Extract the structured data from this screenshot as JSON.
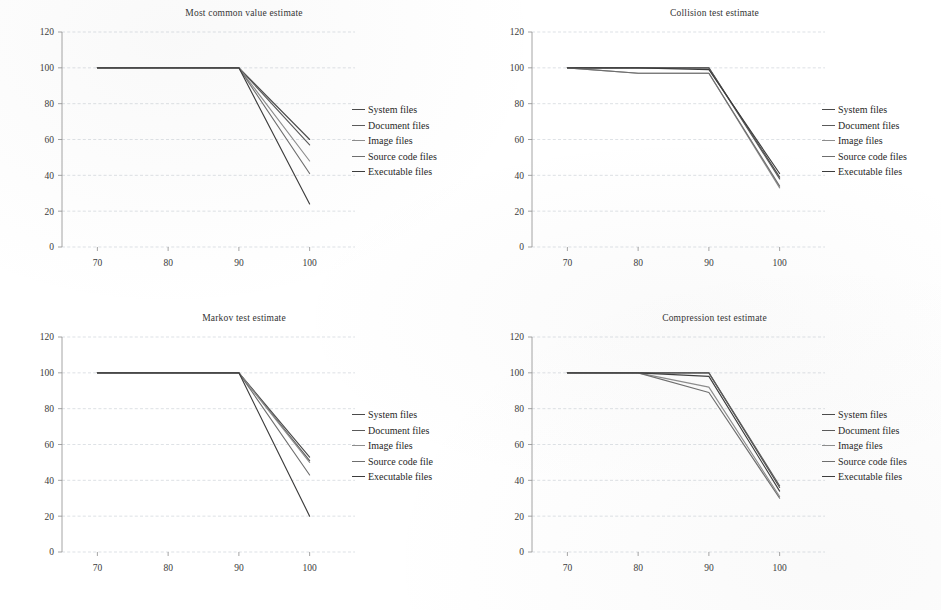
{
  "page": {
    "background": "#ffffff",
    "ink": "#2b2b2b"
  },
  "axes": {
    "y_ticks": [
      "0",
      "20",
      "40",
      "60",
      "80",
      "100",
      "120"
    ],
    "x_ticks": [
      "70",
      "80",
      "90",
      "100"
    ],
    "ylim": [
      0,
      120
    ],
    "xlim": [
      65,
      105
    ],
    "grid": true
  },
  "series_colors": [
    "#4a4a4a",
    "#5a5a5a",
    "#8d8d8d",
    "#6e6e6e",
    "#3c3c3c"
  ],
  "chart_data": [
    {
      "type": "line",
      "title": "Most common value estimate",
      "xlabel": "",
      "ylabel": "",
      "x": [
        70,
        90,
        100
      ],
      "xlim": [
        65,
        105
      ],
      "ylim": [
        0,
        120
      ],
      "grid": true,
      "legend_position": "right",
      "series": [
        {
          "name": "System files",
          "values": [
            100,
            100,
            60
          ]
        },
        {
          "name": "Document files",
          "values": [
            100,
            100,
            57
          ]
        },
        {
          "name": "Image files",
          "values": [
            100,
            100,
            48
          ]
        },
        {
          "name": "Source code files",
          "values": [
            100,
            100,
            41
          ]
        },
        {
          "name": "Executable files",
          "values": [
            100,
            100,
            24
          ]
        }
      ]
    },
    {
      "type": "line",
      "title": "Collision test estimate",
      "xlabel": "",
      "ylabel": "",
      "x": [
        70,
        80,
        90,
        100
      ],
      "xlim": [
        65,
        105
      ],
      "ylim": [
        0,
        120
      ],
      "grid": true,
      "legend_position": "right",
      "series": [
        {
          "name": "System files",
          "values": [
            100,
            100,
            100,
            39
          ]
        },
        {
          "name": "Document files",
          "values": [
            100,
            100,
            100,
            38
          ]
        },
        {
          "name": "Image files",
          "values": [
            100,
            97,
            97,
            33
          ]
        },
        {
          "name": "Source code files",
          "values": [
            100,
            97,
            97,
            34
          ]
        },
        {
          "name": "Executable files",
          "values": [
            100,
            100,
            99,
            41
          ]
        }
      ]
    },
    {
      "type": "line",
      "title": "Markov test estimate",
      "xlabel": "",
      "ylabel": "",
      "x": [
        70,
        90,
        100
      ],
      "xlim": [
        65,
        105
      ],
      "ylim": [
        0,
        120
      ],
      "grid": true,
      "legend_position": "right",
      "series": [
        {
          "name": "System files",
          "values": [
            100,
            100,
            53
          ]
        },
        {
          "name": "Document files",
          "values": [
            100,
            100,
            51
          ]
        },
        {
          "name": "Image files",
          "values": [
            100,
            100,
            50
          ]
        },
        {
          "name": "Source code file",
          "values": [
            100,
            100,
            43
          ]
        },
        {
          "name": "Executable files",
          "values": [
            100,
            100,
            20
          ]
        }
      ]
    },
    {
      "type": "line",
      "title": "Compression test estimate",
      "xlabel": "",
      "ylabel": "",
      "x": [
        70,
        80,
        90,
        100
      ],
      "xlim": [
        65,
        105
      ],
      "ylim": [
        0,
        120
      ],
      "grid": true,
      "legend_position": "right",
      "series": [
        {
          "name": "System files",
          "values": [
            100,
            100,
            100,
            36
          ]
        },
        {
          "name": "Document files",
          "values": [
            100,
            100,
            100,
            37
          ]
        },
        {
          "name": "Image files",
          "values": [
            100,
            100,
            92,
            31
          ]
        },
        {
          "name": "Source code files",
          "values": [
            100,
            100,
            89,
            30
          ]
        },
        {
          "name": "Executable files",
          "values": [
            100,
            100,
            98,
            34
          ]
        }
      ]
    }
  ]
}
